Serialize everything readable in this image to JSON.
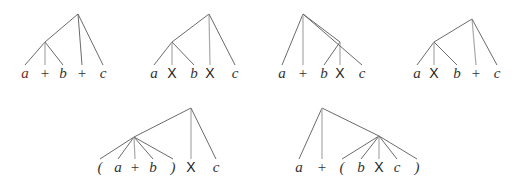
{
  "diagram": {
    "colors": {
      "edge": "#6b6b6b",
      "edge_light": "#a9a9a9",
      "text": "#333333",
      "highlight_var": "#7a2a2a"
    },
    "trees": [
      {
        "id": "tree-1",
        "expression": "a + b + c",
        "grouping": "(a + b) + c",
        "root": {
          "x": 78,
          "y": 14
        },
        "internal": {
          "x": 45,
          "y": 42
        },
        "leaves": [
          {
            "label": "a",
            "kind": "var",
            "x": 25,
            "parent": "internal",
            "highlight": true
          },
          {
            "label": "+",
            "kind": "op",
            "x": 45,
            "parent": "internal"
          },
          {
            "label": "b",
            "kind": "var",
            "x": 63,
            "parent": "internal"
          },
          {
            "label": "+",
            "kind": "op",
            "x": 82,
            "parent": "root"
          },
          {
            "label": "c",
            "kind": "var",
            "x": 103,
            "parent": "root"
          }
        ]
      },
      {
        "id": "tree-2",
        "expression": "a X b X c",
        "grouping": "(a X b) X c",
        "root": {
          "x": 209,
          "y": 14
        },
        "internal": {
          "x": 172,
          "y": 42
        },
        "leaves": [
          {
            "label": "a",
            "kind": "var",
            "x": 154,
            "parent": "internal"
          },
          {
            "label": "X",
            "kind": "times",
            "x": 172,
            "parent": "internal"
          },
          {
            "label": "b",
            "kind": "var",
            "x": 194,
            "parent": "internal"
          },
          {
            "label": "X",
            "kind": "times",
            "x": 210,
            "parent": "root"
          },
          {
            "label": "c",
            "kind": "var",
            "x": 235,
            "parent": "root"
          }
        ]
      },
      {
        "id": "tree-3",
        "expression": "a + b X c",
        "grouping": "a + (b X c)",
        "root": {
          "x": 303,
          "y": 14
        },
        "internal": {
          "x": 340,
          "y": 42
        },
        "leaves": [
          {
            "label": "a",
            "kind": "var",
            "x": 282,
            "parent": "root"
          },
          {
            "label": "+",
            "kind": "op",
            "x": 303,
            "parent": "root"
          },
          {
            "label": "b",
            "kind": "var",
            "x": 324,
            "parent": "internal"
          },
          {
            "label": "X",
            "kind": "times",
            "x": 340,
            "parent": "internal"
          },
          {
            "label": "c",
            "kind": "var",
            "x": 362,
            "parent": "root"
          }
        ]
      },
      {
        "id": "tree-4",
        "expression": "a X b + c",
        "grouping": "(a X b) + c",
        "root": {
          "x": 472,
          "y": 19
        },
        "internal": {
          "x": 434,
          "y": 42
        },
        "leaves": [
          {
            "label": "a",
            "kind": "var",
            "x": 417,
            "parent": "internal"
          },
          {
            "label": "X",
            "kind": "times",
            "x": 434,
            "parent": "internal"
          },
          {
            "label": "b",
            "kind": "var",
            "x": 457,
            "parent": "internal"
          },
          {
            "label": "+",
            "kind": "op",
            "x": 476,
            "parent": "root",
            "light_edge": true
          },
          {
            "label": "c",
            "kind": "var",
            "x": 497,
            "parent": "root"
          }
        ]
      },
      {
        "id": "tree-5",
        "expression": "( a + b ) X c",
        "grouping": "((a + b)) X c",
        "root": {
          "x": 191,
          "y": 108
        },
        "internal": {
          "x": 134,
          "y": 137
        },
        "leaves": [
          {
            "label": "(",
            "kind": "paren",
            "x": 100,
            "parent": "internal"
          },
          {
            "label": "a",
            "kind": "var",
            "x": 118,
            "parent": "internal"
          },
          {
            "label": "+",
            "kind": "op",
            "x": 135,
            "parent": "internal"
          },
          {
            "label": "b",
            "kind": "var",
            "x": 153,
            "parent": "internal"
          },
          {
            "label": ")",
            "kind": "paren",
            "x": 173,
            "parent": "internal"
          },
          {
            "label": "X",
            "kind": "times",
            "x": 191,
            "parent": "root",
            "light_edge": true
          },
          {
            "label": "c",
            "kind": "var",
            "x": 216,
            "parent": "root"
          }
        ]
      },
      {
        "id": "tree-6",
        "expression": "a + ( b X c )",
        "grouping": "a + ((b X c))",
        "root": {
          "x": 322,
          "y": 108
        },
        "internal": {
          "x": 379,
          "y": 136
        },
        "leaves": [
          {
            "label": "a",
            "kind": "var",
            "x": 299,
            "parent": "root"
          },
          {
            "label": "+",
            "kind": "op",
            "x": 322,
            "parent": "root"
          },
          {
            "label": "(",
            "kind": "paren",
            "x": 342,
            "parent": "internal"
          },
          {
            "label": "b",
            "kind": "var",
            "x": 361,
            "parent": "internal"
          },
          {
            "label": "X",
            "kind": "times",
            "x": 379,
            "parent": "internal"
          },
          {
            "label": "c",
            "kind": "var",
            "x": 397,
            "parent": "internal"
          },
          {
            "label": ")",
            "kind": "paren",
            "x": 417,
            "parent": "internal"
          }
        ]
      }
    ],
    "layout": {
      "top_row": {
        "leaf_y": 65,
        "label_y": 78
      },
      "bottom_row": {
        "leaf_y": 159,
        "label_y": 172
      }
    }
  }
}
